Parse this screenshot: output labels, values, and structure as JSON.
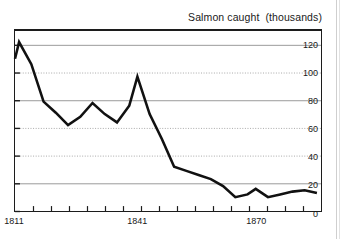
{
  "chart_data": {
    "type": "line",
    "title": "Salmon caught  (thousands)",
    "xlabel": "",
    "ylabel": "",
    "ylim": [
      0,
      130
    ],
    "xlim": [
      1811,
      1886
    ],
    "grid": true,
    "legend": null,
    "yticks": [
      {
        "value": 0,
        "label": "0",
        "grid": "none"
      },
      {
        "value": 20,
        "label": "20",
        "grid": "solid"
      },
      {
        "value": 40,
        "label": "40",
        "grid": "dotted"
      },
      {
        "value": 60,
        "label": "60",
        "grid": "dotted"
      },
      {
        "value": 80,
        "label": "80",
        "grid": "solid"
      },
      {
        "value": 100,
        "label": "100",
        "grid": "dotted"
      },
      {
        "value": 120,
        "label": "120",
        "grid": "solid"
      }
    ],
    "xticks": [
      {
        "value": 1811,
        "label": "1811"
      },
      {
        "value": 1841,
        "label": "1841"
      },
      {
        "value": 1870,
        "label": "1870"
      }
    ],
    "x": [
      1811,
      1812,
      1815,
      1818,
      1821,
      1824,
      1827,
      1830,
      1833,
      1836,
      1839,
      1841,
      1844,
      1847,
      1850,
      1853,
      1856,
      1859,
      1862,
      1865,
      1868,
      1870,
      1873,
      1876,
      1879,
      1882,
      1885
    ],
    "values": [
      110,
      122,
      106,
      79,
      71,
      62,
      68,
      78,
      70,
      64,
      76,
      97,
      70,
      52,
      32,
      29,
      26,
      23,
      18,
      10,
      12,
      16,
      10,
      12,
      14,
      15,
      13
    ],
    "series_color": "#111111",
    "series_width": 2.6
  },
  "axes": {
    "frame_color": "#1c1c1c",
    "gridline_solid_color": "#9a9a9a",
    "gridline_dotted_color": "#a8a8a8"
  }
}
